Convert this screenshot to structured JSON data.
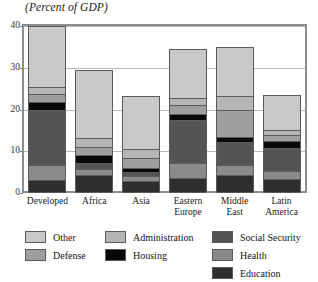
{
  "chart_data": {
    "type": "bar",
    "subtype": "stacked-bar",
    "title": "(Percent of GDP)",
    "xlabel": "",
    "ylabel": "",
    "ylim": [
      0,
      40
    ],
    "yticks": [
      0,
      10,
      20,
      30,
      40
    ],
    "ytick_labels": [
      "0",
      "10",
      "20",
      "30",
      "40"
    ],
    "grid": true,
    "grid_axis": "y",
    "legend_position": "bottom",
    "categories": [
      "Developed",
      "Africa",
      "Asia",
      "Eastern Europe",
      "Middle East",
      "Latin America"
    ],
    "category_lines": [
      [
        "Developed"
      ],
      [
        "Africa"
      ],
      [
        "Asia"
      ],
      [
        "Eastern",
        "Europe"
      ],
      [
        "Middle",
        "East"
      ],
      [
        "Latin",
        "America"
      ]
    ],
    "series": [
      {
        "name": "Education",
        "color": "#2e2e2e",
        "values": [
          3.2,
          4.2,
          2.9,
          3.6,
          4.3,
          3.4
        ]
      },
      {
        "name": "Health",
        "color": "#8a8a8a",
        "values": [
          3.5,
          1.6,
          1.1,
          3.5,
          2.4,
          1.8
        ]
      },
      {
        "name": "Social Security",
        "color": "#545454",
        "values": [
          13.3,
          1.4,
          1.0,
          10.5,
          5.5,
          5.5
        ]
      },
      {
        "name": "Housing",
        "color": "#080808",
        "values": [
          1.7,
          1.9,
          0.9,
          1.3,
          1.2,
          1.7
        ]
      },
      {
        "name": "Defense",
        "color": "#9e9e9e",
        "values": [
          2.0,
          2.0,
          2.6,
          2.1,
          6.5,
          1.5
        ]
      },
      {
        "name": "Administration",
        "color": "#b5b5b5",
        "values": [
          1.6,
          2.1,
          2.0,
          1.8,
          3.3,
          1.1
        ]
      },
      {
        "name": "Other",
        "color": "#c9c9c9",
        "values": [
          14.7,
          16.3,
          12.8,
          11.8,
          11.8,
          8.5
        ]
      }
    ],
    "totals": [
      40.0,
      29.5,
      23.3,
      34.6,
      35.0,
      23.5
    ],
    "value_axis_units": "Percent of GDP"
  },
  "legend": {
    "items": [
      {
        "label": "Other",
        "color": "#c9c9c9"
      },
      {
        "label": "Administration",
        "color": "#b5b5b5"
      },
      {
        "label": "Social Security",
        "color": "#545454"
      },
      {
        "label": "Defense",
        "color": "#9e9e9e"
      },
      {
        "label": "Housing",
        "color": "#080808"
      },
      {
        "label": "Health",
        "color": "#8a8a8a"
      },
      {
        "label": "Education",
        "color": "#2e2e2e"
      }
    ]
  }
}
